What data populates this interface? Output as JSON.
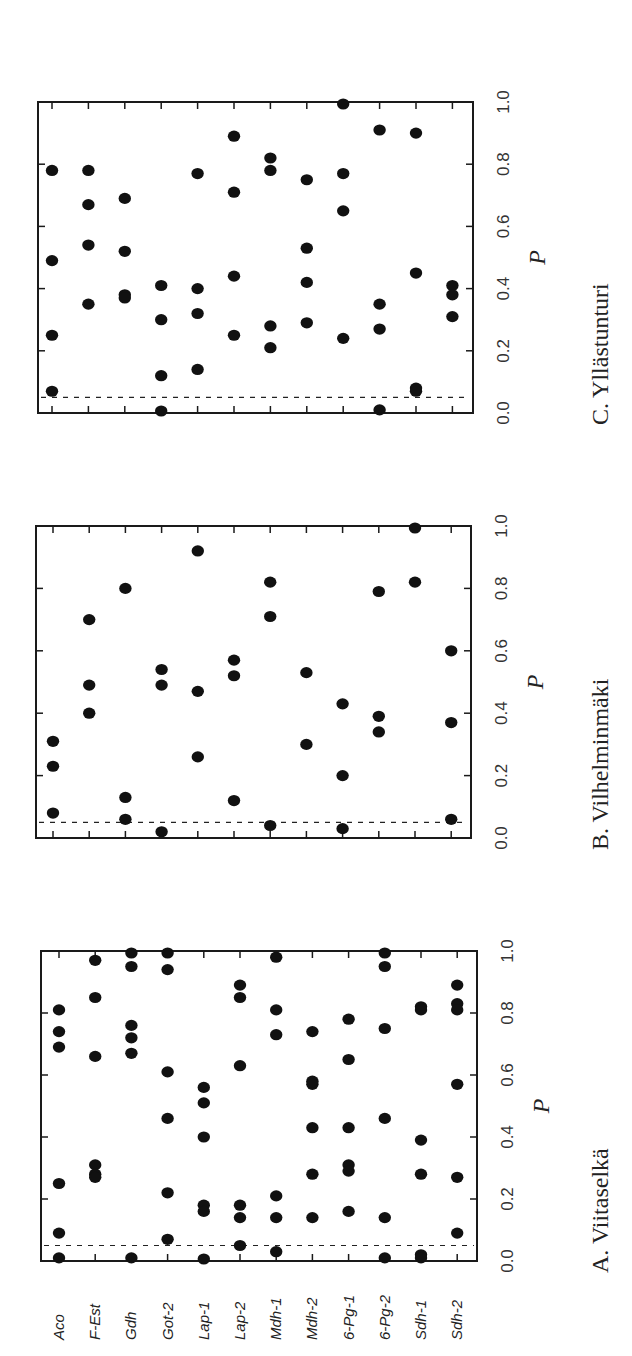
{
  "chart_data": [
    {
      "type": "scatter",
      "panel": "A",
      "title": "A.  Viitaselkä",
      "xlabel": "",
      "ylabel": "P",
      "ylim": [
        0,
        1
      ],
      "ticks": [
        "0.0",
        "0.2",
        "0.4",
        "0.6",
        "0.8",
        "1.0"
      ],
      "threshold": 0.05,
      "categories": [
        "Aco",
        "F-Est",
        "Gdh",
        "Got-2",
        "Lap-1",
        "Lap-2",
        "Mdh-1",
        "Mdh-2",
        "6-Pg-1",
        "6-Pg-2",
        "Sdh-1",
        "Sdh-2"
      ],
      "values": [
        [
          0.81,
          0.74,
          0.69,
          0.25,
          0.09,
          0.01
        ],
        [
          0.97,
          0.85,
          0.66,
          0.31,
          0.28,
          0.27
        ],
        [
          1.0,
          0.95,
          0.76,
          0.72,
          0.67,
          0.01
        ],
        [
          1.0,
          0.94,
          0.61,
          0.46,
          0.22,
          0.07
        ],
        [
          0.56,
          0.51,
          0.4,
          0.18,
          0.16,
          0.0
        ],
        [
          0.89,
          0.85,
          0.63,
          0.18,
          0.14,
          0.05
        ],
        [
          0.98,
          0.81,
          0.73,
          0.21,
          0.14,
          0.03
        ],
        [
          0.74,
          0.58,
          0.57,
          0.43,
          0.28,
          0.14
        ],
        [
          0.78,
          0.65,
          0.43,
          0.31,
          0.29,
          0.16
        ],
        [
          1.0,
          0.95,
          0.75,
          0.46,
          0.14,
          0.01
        ],
        [
          0.82,
          0.81,
          0.39,
          0.28,
          0.02,
          0.01
        ],
        [
          0.89,
          0.83,
          0.81,
          0.57,
          0.27,
          0.09
        ]
      ]
    },
    {
      "type": "scatter",
      "panel": "B",
      "title": "B.  Vilhelminmäki",
      "xlabel": "",
      "ylabel": "P",
      "ylim": [
        0,
        1
      ],
      "ticks": [
        "0.0",
        "0.2",
        "0.4",
        "0.6",
        "0.8",
        "1.0"
      ],
      "threshold": 0.05,
      "categories": [
        "Aco",
        "F-Est",
        "Gdh",
        "Got-2",
        "Lap-1",
        "Lap-2",
        "Mdh-1",
        "Mdh-2",
        "6-Pg-1",
        "6-Pg-2",
        "Sdh-1",
        "Sdh-2"
      ],
      "values": [
        [
          0.31,
          0.23,
          0.08
        ],
        [
          0.7,
          0.49,
          0.4
        ],
        [
          0.8,
          0.13,
          0.06
        ],
        [
          0.54,
          0.49,
          0.02
        ],
        [
          0.92,
          0.47,
          0.26
        ],
        [
          0.57,
          0.52,
          0.12
        ],
        [
          0.82,
          0.71,
          0.04
        ],
        [
          0.53,
          0.3
        ],
        [
          0.43,
          0.2,
          0.03
        ],
        [
          0.79,
          0.39,
          0.34
        ],
        [
          1.0,
          0.82
        ],
        [
          0.6,
          0.37,
          0.06
        ]
      ]
    },
    {
      "type": "scatter",
      "panel": "C",
      "title": "C.  Yllästunturi",
      "xlabel": "",
      "ylabel": "P",
      "ylim": [
        0,
        1
      ],
      "ticks": [
        "0.0",
        "0.2",
        "0.4",
        "0.6",
        "0.8",
        "1.0"
      ],
      "threshold": 0.05,
      "categories": [
        "Aco",
        "F-Est",
        "Gdh",
        "Got-2",
        "Lap-1",
        "Lap-2",
        "Mdh-1",
        "Mdh-2",
        "6-Pg-1",
        "6-Pg-2",
        "Sdh-1",
        "Sdh-2"
      ],
      "values": [
        [
          0.78,
          0.49,
          0.25,
          0.07
        ],
        [
          0.78,
          0.67,
          0.54,
          0.35
        ],
        [
          0.69,
          0.52,
          0.38,
          0.37
        ],
        [
          0.41,
          0.3,
          0.12,
          0.0
        ],
        [
          0.77,
          0.4,
          0.32,
          0.14
        ],
        [
          0.89,
          0.71,
          0.44,
          0.25
        ],
        [
          0.82,
          0.78,
          0.28,
          0.21
        ],
        [
          0.75,
          0.53,
          0.42,
          0.29
        ],
        [
          1.0,
          0.77,
          0.65,
          0.24
        ],
        [
          0.91,
          0.35,
          0.27,
          0.01
        ],
        [
          0.9,
          0.45,
          0.08,
          0.07
        ],
        [
          0.41,
          0.38,
          0.31
        ]
      ]
    }
  ],
  "layout_panels": [
    {
      "x0": 41,
      "x1": 477,
      "y0": 951,
      "y1": 1261,
      "first_locus_x": 59,
      "locus_step": 36.2
    },
    {
      "x0": 36,
      "x1": 471,
      "y0": 526,
      "y1": 838,
      "first_locus_x": 53,
      "locus_step": 36.2
    },
    {
      "x0": 38,
      "x1": 473,
      "y0": 102,
      "y1": 413,
      "first_locus_x": 52,
      "locus_step": 36.4
    }
  ]
}
